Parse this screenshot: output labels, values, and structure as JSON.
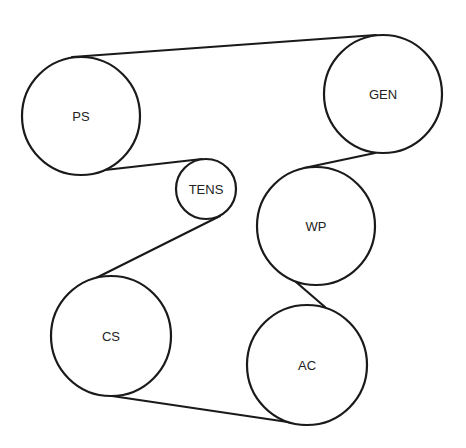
{
  "diagram": {
    "title": "",
    "type": "serpentine-belt-routing",
    "colors": {
      "stroke": "#1a1a1a",
      "label": "#222222",
      "background": "#ffffff"
    },
    "pulleys": [
      {
        "id": "PS",
        "label": "PS",
        "cx": 81,
        "cy": 116,
        "r": 59
      },
      {
        "id": "GEN",
        "label": "GEN",
        "cx": 383,
        "cy": 94,
        "r": 59
      },
      {
        "id": "TENS",
        "label": "TENS",
        "cx": 206,
        "cy": 189,
        "r": 30
      },
      {
        "id": "WP",
        "label": "WP",
        "cx": 316,
        "cy": 226,
        "r": 59
      },
      {
        "id": "CS",
        "label": "CS",
        "cx": 111,
        "cy": 336,
        "r": 60
      },
      {
        "id": "AC",
        "label": "AC",
        "cx": 307,
        "cy": 365,
        "r": 60
      }
    ],
    "belt_segments": [
      {
        "from": "PS",
        "to": "GEN",
        "tangent": "outer-top",
        "description": "PS top to GEN top"
      },
      {
        "from": "GEN",
        "to": "WP",
        "tangent": "outer-side",
        "description": "GEN lower-left to WP upper"
      },
      {
        "from": "WP",
        "to": "AC",
        "tangent": "cross",
        "description": "WP lower-right to AC upper-right (S-wrap)"
      },
      {
        "from": "AC",
        "to": "CS",
        "tangent": "outer-bottom",
        "description": "AC bottom to CS bottom"
      },
      {
        "from": "CS",
        "to": "TENS",
        "tangent": "cross",
        "description": "CS upper-right to TENS lower"
      },
      {
        "from": "TENS",
        "to": "PS",
        "tangent": "outer",
        "description": "TENS top to PS bottom"
      }
    ],
    "segment_endpoints": [
      {
        "x1": 72,
        "y1": 57,
        "x2": 376,
        "y2": 35
      },
      {
        "x1": 375,
        "y1": 153,
        "x2": 304,
        "y2": 168
      },
      {
        "x1": 296,
        "y1": 282,
        "x2": 325,
        "y2": 307
      },
      {
        "x1": 308,
        "y1": 425,
        "x2": 112,
        "y2": 396
      },
      {
        "x1": 96,
        "y1": 278,
        "x2": 220,
        "y2": 216
      },
      {
        "x1": 202,
        "y1": 159,
        "x2": 105,
        "y2": 170
      }
    ]
  }
}
